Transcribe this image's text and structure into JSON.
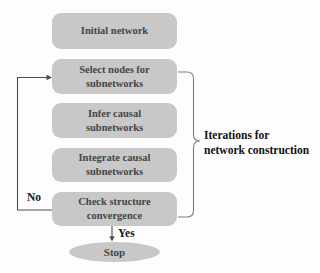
{
  "diagram": {
    "nodes": [
      {
        "id": "initial",
        "label": "Initial network"
      },
      {
        "id": "select",
        "label": "Select nodes for subnetworks"
      },
      {
        "id": "infer",
        "label": "Infer causal subnetworks"
      },
      {
        "id": "integrate",
        "label": "Integrate causal subnetworks"
      },
      {
        "id": "check",
        "label": "Check structure convergence"
      }
    ],
    "terminal": {
      "id": "stop",
      "label": "Stop"
    },
    "edge_labels": {
      "no": "No",
      "yes": "Yes"
    },
    "bracket_label": {
      "line1": "Iterations for",
      "line2": "network construction"
    },
    "edges": [
      {
        "from": "check",
        "to": "stop",
        "label": "Yes"
      },
      {
        "from": "check",
        "to": "select",
        "label": "No"
      }
    ],
    "colors": {
      "node_fill": "#c8c8c8",
      "node_text": "#454545",
      "connector_line": "#4d4d4d",
      "bracket_line": "#7d7d7d",
      "label_text": "#161616",
      "background": "#fdfdfd"
    }
  }
}
